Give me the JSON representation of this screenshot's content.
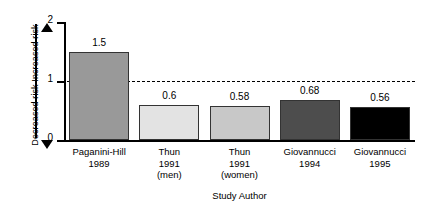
{
  "chart_data": {
    "type": "bar",
    "title": "",
    "xlabel": "Study Author",
    "ylabel": "",
    "ylim": [
      0,
      2
    ],
    "yticks": [
      "0",
      "1",
      "2"
    ],
    "grid": false,
    "legend": "none",
    "reference_line": {
      "value": 1,
      "style": "dashed",
      "label": ""
    },
    "axis_direction_labels": {
      "up": "Increased risk",
      "down": "Decreased risk"
    },
    "categories": [
      "Paganini-Hill\n1989",
      "Thun\n1991\n(men)",
      "Thun\n1991\n(women)",
      "Giovannucci\n1994",
      "Giovannucci\n1995"
    ],
    "values": [
      1.5,
      0.6,
      0.58,
      0.68,
      0.56
    ],
    "bars": [
      {
        "category_lines": [
          "Paganini-Hill",
          "1989"
        ],
        "value": 1.5,
        "value_label": "1.5",
        "color": "#999999"
      },
      {
        "category_lines": [
          "Thun",
          "1991",
          "(men)"
        ],
        "value": 0.6,
        "value_label": "0.6",
        "color": "#e3e3e3"
      },
      {
        "category_lines": [
          "Thun",
          "1991",
          "(women)"
        ],
        "value": 0.58,
        "value_label": "0.58",
        "color": "#c8c8c8"
      },
      {
        "category_lines": [
          "Giovannucci",
          "1994"
        ],
        "value": 0.68,
        "value_label": "0.68",
        "color": "#4d4d4d"
      },
      {
        "category_lines": [
          "Giovannucci",
          "1995"
        ],
        "value": 0.56,
        "value_label": "0.56",
        "color": "#000000"
      }
    ]
  }
}
